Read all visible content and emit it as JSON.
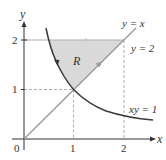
{
  "diagram": {
    "axes": {
      "x_label": "x",
      "y_label": "y",
      "origin_label": "0",
      "x_ticks": [
        "1",
        "2"
      ],
      "y_ticks": [
        "1",
        "2"
      ]
    },
    "curves": {
      "line_label": "y = x",
      "horizontal_label": "y = 2",
      "hyperbola_label": "xy = 1"
    },
    "region": {
      "label": "R",
      "fill_color": "#d9d9d9"
    },
    "colors": {
      "axis": "#333333",
      "line": "#9a9a9a",
      "curve": "#3a3a3a",
      "dashed": "#9a9a9a"
    }
  }
}
